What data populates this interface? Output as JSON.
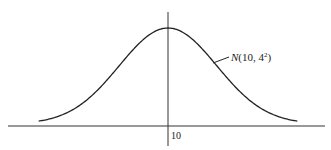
{
  "chart_data": {
    "type": "line",
    "title": "",
    "series": [
      {
        "name": "N(10, 4^2)",
        "mean": 10,
        "sd": 4
      }
    ],
    "annotation": {
      "text_main": "N(10, 4",
      "text_sup": "2",
      "text_end": ")"
    },
    "x_ticks": [
      "10"
    ],
    "xlabel": "",
    "ylabel": "",
    "grid": false,
    "legend": "none"
  },
  "colors": {
    "ink": "#1a1a1a",
    "background": "#ffffff"
  }
}
